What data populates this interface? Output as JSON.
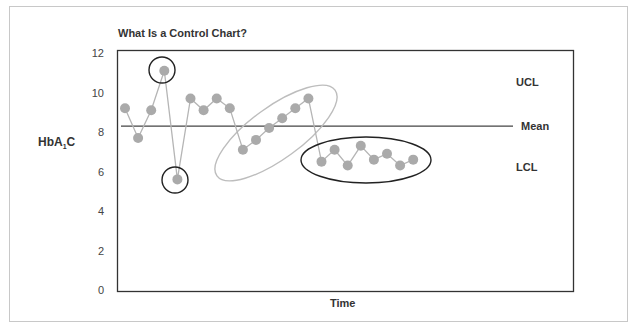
{
  "chart_data": {
    "type": "line",
    "title": "What Is a Control Chart?",
    "xlabel": "Time",
    "ylabel": "HbA1C",
    "ylabel_main": "HbA",
    "ylabel_sub": "1",
    "ylabel_tail": "C",
    "ylim": [
      0,
      12
    ],
    "yticks": [
      0,
      2,
      4,
      6,
      8,
      10,
      12
    ],
    "grid": false,
    "mean": 8.3,
    "reference_labels": {
      "ucl": "UCL",
      "mean": "Mean",
      "lcl": "LCL"
    },
    "x": [
      1,
      2,
      3,
      4,
      5,
      6,
      7,
      8,
      9,
      10,
      11,
      12,
      13,
      14,
      15,
      16,
      17,
      18,
      19,
      20,
      21,
      22,
      23
    ],
    "series": [
      {
        "name": "HbA1C",
        "values": [
          9.2,
          7.7,
          9.1,
          11.1,
          5.6,
          9.7,
          9.1,
          9.7,
          9.2,
          7.1,
          7.6,
          8.2,
          8.7,
          9.2,
          9.7,
          6.5,
          7.1,
          6.3,
          7.3,
          6.6,
          6.9,
          6.3,
          6.6
        ]
      }
    ],
    "annotations": [
      {
        "type": "circle",
        "target_point": 4,
        "meaning": "point above UCL"
      },
      {
        "type": "circle",
        "target_point": 5,
        "meaning": "point below LCL"
      },
      {
        "type": "ellipse",
        "target_points": [
          10,
          15
        ],
        "meaning": "upward trend"
      },
      {
        "type": "ellipse",
        "target_points": [
          16,
          23
        ],
        "meaning": "shift below mean"
      }
    ],
    "colors": {
      "points": "#aaaaaa",
      "lines": "#b5b5b5",
      "axis": "#333333",
      "trend_ellipse": "#bbbbbb",
      "highlight": "#222222"
    }
  }
}
